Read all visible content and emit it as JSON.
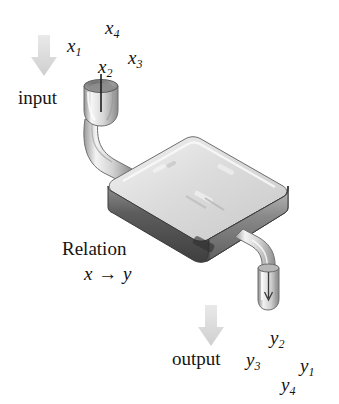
{
  "figure": {
    "type": "diagram",
    "background_color": "#ffffff",
    "ink_color": "#141414"
  },
  "input": {
    "arrow_name": "down-arrow",
    "arrow_color": "#dddddd",
    "label": "input",
    "variables": [
      {
        "base": "x",
        "sub": "1"
      },
      {
        "base": "x",
        "sub": "2"
      },
      {
        "base": "x",
        "sub": "3"
      },
      {
        "base": "x",
        "sub": "4"
      }
    ]
  },
  "machine": {
    "label": "Relation",
    "mapping": "x → y",
    "body_color": "#d9d9d9",
    "top_color": "#e6e6e6",
    "edge_color": "#555555",
    "pipe_color": "#e8e8e8"
  },
  "output": {
    "arrow_name": "down-arrow",
    "arrow_color": "#dddddd",
    "label": "output",
    "variables": [
      {
        "base": "y",
        "sub": "1"
      },
      {
        "base": "y",
        "sub": "2"
      },
      {
        "base": "y",
        "sub": "3"
      },
      {
        "base": "y",
        "sub": "4"
      }
    ]
  }
}
